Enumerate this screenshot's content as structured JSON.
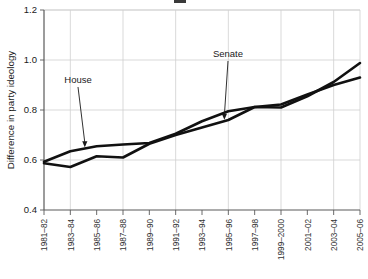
{
  "figure": {
    "background": "#ffffff",
    "line_color": "#111111",
    "grid_color": "#cfcfcf",
    "axis_color": "#5a5a5a"
  },
  "annotations": [
    {
      "name": "house",
      "label": "House",
      "x_index": 1.55,
      "y_value": 0.645,
      "label_x": 78,
      "label_y": 83
    },
    {
      "name": "senate",
      "label": "Senate",
      "x_index": 6.85,
      "y_value": 0.755,
      "label_x": 228,
      "label_y": 57
    }
  ],
  "chart_data": {
    "type": "line",
    "title": "",
    "xlabel": "",
    "ylabel": "Difference in party ideology",
    "ylim": [
      0.4,
      1.2
    ],
    "yticks": [
      0.4,
      0.6,
      0.8,
      1.0,
      1.2
    ],
    "ytick_labels": [
      "0.4",
      "0.6",
      "0.8",
      "1.0",
      "1.2"
    ],
    "grid": "horizontal-and-vertical-every-other-tick",
    "legend": "none (inline annotated labels with leader arrows)",
    "categories": [
      "1981–82",
      "1983–84",
      "1985–86",
      "1987–88",
      "1989–90",
      "1991–92",
      "1993–94",
      "1995–96",
      "1997–98",
      "1999–2000",
      "2001–02",
      "2003–04",
      "2005–06"
    ],
    "series": [
      {
        "name": "House",
        "values": [
          0.593,
          0.635,
          0.655,
          0.662,
          0.668,
          0.705,
          0.755,
          0.795,
          0.812,
          0.822,
          0.862,
          0.9,
          0.93
        ]
      },
      {
        "name": "Senate",
        "values": [
          0.587,
          0.572,
          0.615,
          0.61,
          0.665,
          0.7,
          0.73,
          0.76,
          0.812,
          0.81,
          0.855,
          0.912,
          0.988
        ]
      }
    ]
  }
}
